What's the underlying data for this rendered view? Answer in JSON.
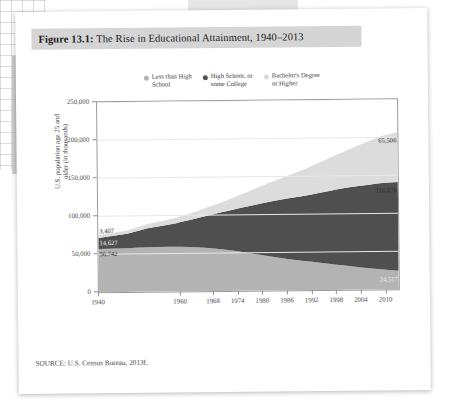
{
  "figure": {
    "number": "Figure 13.1:",
    "caption": " The Rise in Educational Attainment, 1940–2013"
  },
  "source": "SOURCE: U.S. Census Bureau, 2013f.",
  "legend": [
    {
      "label": "Less than High\nSchool",
      "color": "#b3b3b3",
      "name": "legend-less-than-high-school"
    },
    {
      "label": "High Schoor, or\nsome College",
      "color": "#4f4f4f",
      "name": "legend-high-school-some-college"
    },
    {
      "label": "Bachelor's Degree\nor Higher",
      "color": "#dcdcdc",
      "name": "legend-bachelors-or-higher"
    }
  ],
  "annotations": {
    "start_less_than_high_school": "56,742",
    "start_high_school": "14,627",
    "start_bachelors": "3,407",
    "end_bachelors": "65,506",
    "end_high_school": "116,676",
    "end_less_than_high_school": "24,517"
  },
  "chart_data": {
    "type": "area",
    "title": "The Rise in Educational Attainment, 1940–2013",
    "xlabel": "",
    "ylabel": "U.S. population age 25 and\nolder (in thousands)",
    "stacked": true,
    "grid": true,
    "legend_position": "top",
    "xlim": [
      1940,
      2013
    ],
    "ylim": [
      0,
      250000
    ],
    "yticks": [
      0,
      50000,
      100000,
      150000,
      200000,
      250000
    ],
    "ytick_labels": [
      "0",
      "50,000",
      "100,000",
      "150,000",
      "200,000",
      "250,000"
    ],
    "xticks": [
      1940,
      1960,
      1968,
      1974,
      1980,
      1986,
      1992,
      1998,
      2004,
      2010
    ],
    "xtick_labels": [
      "1940",
      "1960",
      "1968",
      "1974",
      "1980",
      "1986",
      "1992",
      "1998",
      "2004",
      "2010"
    ],
    "x": [
      1940,
      1947,
      1950,
      1952,
      1957,
      1959,
      1960,
      1962,
      1964,
      1966,
      1968,
      1970,
      1972,
      1974,
      1976,
      1978,
      1980,
      1982,
      1984,
      1986,
      1988,
      1990,
      1992,
      1994,
      1996,
      1998,
      2000,
      2002,
      2004,
      2006,
      2008,
      2010,
      2013
    ],
    "series": [
      {
        "name": "Less than High School",
        "color": "#b3b3b3",
        "values": [
          56742,
          57500,
          58200,
          58600,
          58900,
          58900,
          58800,
          58400,
          57900,
          57200,
          56200,
          55000,
          53500,
          52000,
          50200,
          48400,
          46500,
          44700,
          43000,
          41300,
          39800,
          38400,
          37200,
          35900,
          34500,
          33200,
          31900,
          30600,
          29300,
          28100,
          27000,
          25800,
          24517
        ]
      },
      {
        "name": "High School, or some College",
        "color": "#4f4f4f",
        "values": [
          14627,
          19000,
          22500,
          25000,
          29000,
          31000,
          32500,
          35000,
          38000,
          41500,
          45000,
          48500,
          52500,
          56500,
          60500,
          64500,
          68500,
          72500,
          76000,
          79500,
          82500,
          85500,
          88500,
          92000,
          95500,
          99000,
          102000,
          105000,
          107500,
          110000,
          112500,
          114500,
          116676
        ]
      },
      {
        "name": "Bachelor's Degree or Higher",
        "color": "#dcdcdc",
        "values": [
          3407,
          4200,
          4900,
          5400,
          6400,
          7000,
          7400,
          8200,
          9200,
          10300,
          11600,
          13000,
          14800,
          16700,
          18700,
          20800,
          23000,
          25200,
          27500,
          29800,
          32200,
          34600,
          37200,
          39900,
          42600,
          45400,
          48200,
          51000,
          54200,
          57400,
          60300,
          63000,
          65506
        ]
      }
    ]
  }
}
